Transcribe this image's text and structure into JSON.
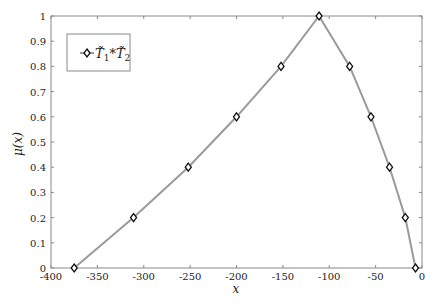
{
  "chart_data": {
    "type": "line",
    "title": "",
    "xlabel": "x",
    "ylabel": "μ(x)",
    "xlim": [
      -400,
      0
    ],
    "ylim": [
      0,
      1
    ],
    "xticks": [
      -400,
      -350,
      -300,
      -250,
      -200,
      -150,
      -100,
      -50,
      0
    ],
    "xtick_labels": [
      "-400",
      "-350",
      "-300",
      "-250",
      "-200",
      "-150",
      "-100",
      "-50",
      "0"
    ],
    "yticks": [
      0,
      0.1,
      0.2,
      0.3,
      0.4,
      0.5,
      0.6,
      0.7,
      0.8,
      0.9,
      1
    ],
    "ytick_labels": [
      "0",
      "0.1",
      "0.2",
      "0.3",
      "0.4",
      "0.5",
      "0.6",
      "0.7",
      "0.8",
      "0.9",
      "1"
    ],
    "grid": false,
    "legend_position": "top-left",
    "series": [
      {
        "name": "T̃1*T̃2",
        "legend_main": "T̃",
        "legend_sub1": "1",
        "legend_star": "*",
        "legend_main2": "T̃",
        "legend_sub2": "2",
        "color": "#9a9a9a",
        "marker": "diamond",
        "marker_color": "#111111",
        "x": [
          -375,
          -311,
          -252,
          -200,
          -152,
          -111,
          -78,
          -55,
          -35,
          -18,
          -7
        ],
        "y": [
          0,
          0.2,
          0.4,
          0.6,
          0.8,
          1.0,
          0.8,
          0.6,
          0.4,
          0.2,
          0
        ]
      }
    ]
  }
}
